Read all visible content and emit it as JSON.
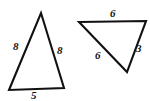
{
  "figure": {
    "type": "geometry-diagram",
    "background_color": "#ffffff",
    "stroke_color": "#111111",
    "label_color": "#111111",
    "canvas": {
      "width": 150,
      "height": 101
    }
  },
  "shapes": [
    {
      "id": "left-triangle",
      "name": "left-triangle",
      "kind": "triangle",
      "points": "41,13 64,88 9,90",
      "vertices": [
        {
          "name": "apex",
          "x": 41,
          "y": 13
        },
        {
          "name": "bottom-right",
          "x": 64,
          "y": 88
        },
        {
          "name": "bottom-left",
          "x": 9,
          "y": 90
        }
      ],
      "labels": [
        {
          "id": "left-triangle-label-left",
          "name": "left-triangle-side-label-left",
          "text": "8",
          "x": 13,
          "y": 41
        },
        {
          "id": "left-triangle-label-right",
          "name": "left-triangle-side-label-right",
          "text": "8",
          "x": 57,
          "y": 45
        },
        {
          "id": "left-triangle-label-bottom",
          "name": "left-triangle-side-label-bottom",
          "text": "5",
          "x": 31,
          "y": 90
        }
      ]
    },
    {
      "id": "right-triangle",
      "name": "right-triangle",
      "kind": "triangle",
      "points": "79,22 146,21 127,72",
      "vertices": [
        {
          "name": "top-left",
          "x": 79,
          "y": 22
        },
        {
          "name": "top-right",
          "x": 146,
          "y": 21
        },
        {
          "name": "bottom",
          "x": 127,
          "y": 72
        }
      ],
      "labels": [
        {
          "id": "right-triangle-label-top",
          "name": "right-triangle-side-label-top",
          "text": "6",
          "x": 110,
          "y": 8
        },
        {
          "id": "right-triangle-label-right",
          "name": "right-triangle-side-label-right",
          "text": "3",
          "x": 136,
          "y": 43
        },
        {
          "id": "right-triangle-label-left",
          "name": "right-triangle-side-label-left",
          "text": "6",
          "x": 95,
          "y": 50
        }
      ]
    }
  ]
}
